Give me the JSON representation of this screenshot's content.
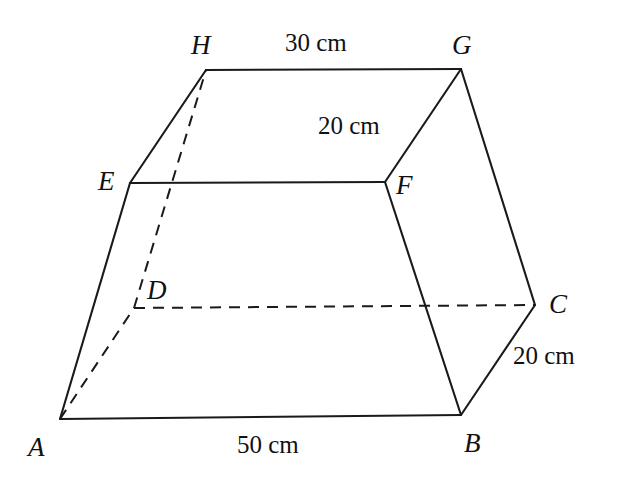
{
  "figure": {
    "background_color": "#ffffff",
    "stroke_color": "#1a1a1a",
    "vertices": [
      {
        "name": "A",
        "label": "A",
        "x": 60,
        "y": 419,
        "label_x": 28,
        "label_y": 434
      },
      {
        "name": "B",
        "label": "B",
        "x": 461,
        "y": 415,
        "label_x": 464,
        "label_y": 430
      },
      {
        "name": "C",
        "label": "C",
        "x": 535,
        "y": 305,
        "label_x": 549,
        "label_y": 291
      },
      {
        "name": "D",
        "label": "D",
        "x": 134,
        "y": 308,
        "label_x": 147,
        "label_y": 277
      },
      {
        "name": "E",
        "label": "E",
        "x": 130,
        "y": 183,
        "label_x": 98,
        "label_y": 168
      },
      {
        "name": "F",
        "label": "F",
        "x": 385,
        "y": 182,
        "label_x": 396,
        "label_y": 172
      },
      {
        "name": "G",
        "label": "G",
        "x": 461,
        "y": 69,
        "label_x": 452,
        "label_y": 32
      },
      {
        "name": "H",
        "label": "H",
        "x": 206,
        "y": 70,
        "label_x": 191,
        "label_y": 32
      }
    ],
    "solid_edges": [
      {
        "name": "edge-a-b",
        "from": "A",
        "to": "B"
      },
      {
        "name": "edge-b-c",
        "from": "B",
        "to": "C"
      },
      {
        "name": "edge-c-g",
        "from": "C",
        "to": "G"
      },
      {
        "name": "edge-g-h",
        "from": "G",
        "to": "H"
      },
      {
        "name": "edge-h-e",
        "from": "H",
        "to": "E"
      },
      {
        "name": "edge-e-a",
        "from": "E",
        "to": "A"
      },
      {
        "name": "edge-e-f",
        "from": "E",
        "to": "F"
      },
      {
        "name": "edge-f-g",
        "from": "F",
        "to": "G"
      },
      {
        "name": "edge-f-b",
        "from": "F",
        "to": "B"
      }
    ],
    "dashed_edges": [
      {
        "name": "edge-a-d",
        "from": "A",
        "to": "D"
      },
      {
        "name": "edge-d-h",
        "from": "D",
        "to": "H"
      },
      {
        "name": "edge-d-c",
        "from": "D",
        "to": "C"
      }
    ],
    "dimensions": [
      {
        "name": "dimension-hg-top",
        "text": "30 cm",
        "edge": "HG",
        "x": 285,
        "y": 30
      },
      {
        "name": "dimension-gf-depth",
        "text": "20 cm",
        "edge": "GF",
        "x": 318,
        "y": 113
      },
      {
        "name": "dimension-ab-bottom",
        "text": "50 cm",
        "edge": "AB",
        "x": 237,
        "y": 432
      },
      {
        "name": "dimension-bc-depth",
        "text": "20 cm",
        "edge": "BC",
        "x": 513,
        "y": 343
      }
    ]
  }
}
